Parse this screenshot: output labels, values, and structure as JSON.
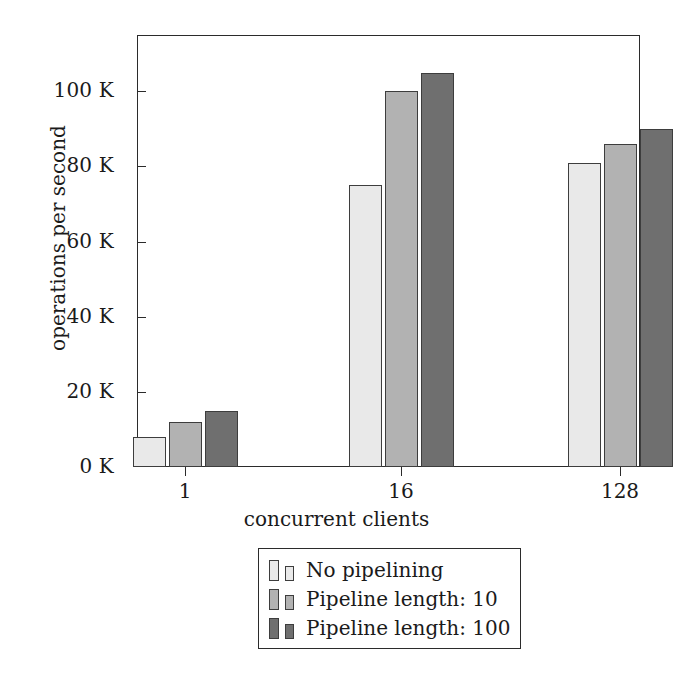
{
  "chart_data": {
    "type": "bar",
    "title": "",
    "xlabel": "concurrent clients",
    "ylabel": "operations per second",
    "categories": [
      "1",
      "16",
      "128"
    ],
    "series": [
      {
        "name": "No pipelining",
        "values": [
          8000,
          75000,
          81000
        ],
        "color": "#e9e9e9"
      },
      {
        "name": "Pipeline length: 10",
        "values": [
          12000,
          100000,
          86000
        ],
        "color": "#b2b2b2"
      },
      {
        "name": "Pipeline length: 100",
        "values": [
          15000,
          105000,
          90000
        ],
        "color": "#6f6f6f"
      }
    ],
    "ylim": [
      0,
      115000
    ],
    "yticks": [
      0,
      20000,
      40000,
      60000,
      80000,
      100000
    ],
    "ytick_labels": [
      "0 K",
      "20 K",
      "40 K",
      "60 K",
      "80 K",
      "100 K"
    ],
    "xtick_labels": [
      "1",
      "16",
      "128"
    ],
    "grid": false,
    "legend_position": "below-axis-center",
    "bar_outline_color": "#3d3d3d",
    "axis_color": "#2b2b2b",
    "background_color": "#ffffff"
  },
  "axes": {
    "ylabel": "operations per second",
    "xlabel": "concurrent clients",
    "yticks": [
      {
        "label": "0 K",
        "value": 0
      },
      {
        "label": "20 K",
        "value": 20000
      },
      {
        "label": "40 K",
        "value": 40000
      },
      {
        "label": "60 K",
        "value": 60000
      },
      {
        "label": "80 K",
        "value": 80000
      },
      {
        "label": "100 K",
        "value": 100000
      }
    ],
    "xticks": [
      {
        "label": "1",
        "value": 1
      },
      {
        "label": "16",
        "value": 16
      },
      {
        "label": "128",
        "value": 128
      }
    ]
  },
  "legend": {
    "entries": [
      {
        "label": "No pipelining",
        "color": "#e9e9e9"
      },
      {
        "label": "Pipeline length: 10",
        "color": "#b2b2b2"
      },
      {
        "label": "Pipeline length: 100",
        "color": "#6f6f6f"
      }
    ]
  }
}
